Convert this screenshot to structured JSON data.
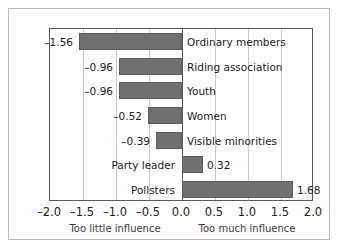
{
  "chart_data": {
    "type": "bar",
    "orientation": "horizontal",
    "title": "",
    "xlabel": "",
    "ylabel": "",
    "xlim": [
      -2.0,
      2.0
    ],
    "grid": true,
    "legend": null,
    "categories": [
      "Ordinary members",
      "Riding association",
      "Youth",
      "Women",
      "Visible minorities",
      "Party leader",
      "Pollsters"
    ],
    "values": [
      -1.56,
      -0.96,
      -0.96,
      -0.52,
      -0.39,
      0.32,
      1.68
    ],
    "value_labels": [
      "–1.56",
      "–0.96",
      "–0.96",
      "–0.52",
      "–0.39",
      "0.32",
      "1.68"
    ],
    "xticks": [
      -2.0,
      -1.5,
      -1.0,
      -0.5,
      0.0,
      0.5,
      1.0,
      1.5,
      2.0
    ],
    "xtick_labels": [
      "–2.0",
      "–1.5",
      "–1.0",
      "–0.5",
      "0.0",
      "0.5",
      "1.0",
      "1.5",
      "2.0"
    ],
    "annotations": [
      {
        "text": "Too little influence",
        "x": -1.0
      },
      {
        "text": "Too much influence",
        "x": 1.0
      }
    ],
    "colors": {
      "bar_fill": "#707070",
      "bar_edge": "#5d5d5d",
      "gridline": "#c9c9c9",
      "zeroline": "#5a5a5a",
      "axis": "#5a5a5a",
      "outer_frame": "#b9b9b9",
      "text": "#1a1a1a",
      "background": "#ffffff"
    }
  }
}
